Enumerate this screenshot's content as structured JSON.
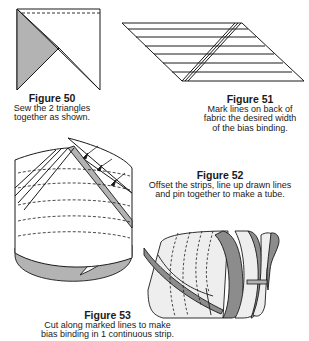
{
  "figures": [
    {
      "id": "figure-50",
      "title": "Figure 50",
      "desc_lines": [
        "Sew the 2 triangles",
        "together as shown."
      ]
    },
    {
      "id": "figure-51",
      "title": "Figure 51",
      "desc_lines": [
        "Mark lines on back of",
        "fabric the desired width",
        "of the bias binding."
      ]
    },
    {
      "id": "figure-52",
      "title": "Figure 52",
      "desc_lines": [
        "Offset the strips, line up drawn lines",
        "and pin together to make a tube."
      ]
    },
    {
      "id": "figure-53",
      "title": "Figure 53",
      "desc_lines": [
        "Cut along marked lines to make",
        "bias binding in 1 continuous strip."
      ]
    }
  ],
  "colors": {
    "line": "#1a1a1a",
    "fabric_shade": "#b3b3b3",
    "fabric_dark": "#8c8c8c",
    "fabric_light": "#eeeeee"
  }
}
